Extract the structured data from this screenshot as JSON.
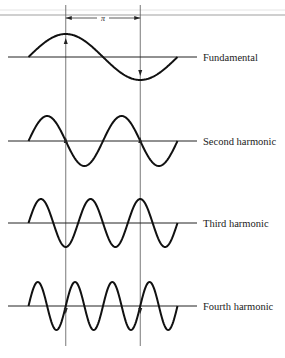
{
  "figure": {
    "title": "",
    "interval_label": "π",
    "interval_arrow": "double-headed",
    "rule_color": "#9a9a9a",
    "wave_color": "#111111",
    "guide_color": "#555555"
  },
  "chart_data": {
    "type": "line",
    "x_range": [
      0,
      6.2832
    ],
    "guide_markers_at": [
      1.5708,
      4.7124
    ],
    "guide_separation_label": "π",
    "series": [
      {
        "name": "Fundamental",
        "harmonic": 1,
        "function": "sin(1·x)",
        "cycles_shown": 1
      },
      {
        "name": "Second harmonic",
        "harmonic": 2,
        "function": "sin(2·x)",
        "cycles_shown": 2
      },
      {
        "name": "Third harmonic",
        "harmonic": 3,
        "function": "sin(3·x)",
        "cycles_shown": 3
      },
      {
        "name": "Fourth harmonic",
        "harmonic": 4,
        "function": "sin(4·x)",
        "cycles_shown": 4
      }
    ],
    "guide_arrows": [
      {
        "series": "Fundamental",
        "left": "up",
        "right": "down"
      },
      {
        "series": "Second harmonic",
        "left": "up",
        "right": "up"
      },
      {
        "series": "Third harmonic",
        "left": "none",
        "right": "none"
      },
      {
        "series": "Fourth harmonic",
        "left": "down",
        "right": "down"
      }
    ]
  }
}
